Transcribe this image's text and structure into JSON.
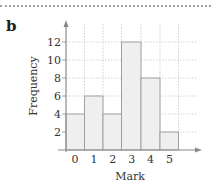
{
  "part_label": "b",
  "chart_data": {
    "type": "bar",
    "title": "",
    "xlabel": "Mark",
    "ylabel": "Frequency",
    "categories": [
      "0",
      "1",
      "2",
      "3",
      "4",
      "5"
    ],
    "values": [
      4,
      6,
      4,
      12,
      8,
      2
    ],
    "yticks": [
      2,
      4,
      6,
      8,
      10,
      12
    ],
    "ylim": [
      0,
      13
    ],
    "grid": true,
    "legend": null
  },
  "colors": {
    "bar_fill": "#efefef",
    "bar_stroke": "#9a9a9a",
    "grid": "#c8c8c8",
    "axis": "#8a8a8a"
  }
}
